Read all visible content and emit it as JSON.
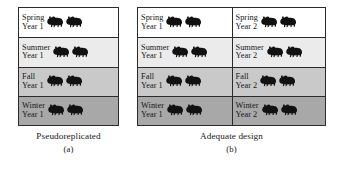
{
  "figure": {
    "background_color": "#ffffff",
    "border_color": "#2b2b2b",
    "text_color": "#15171a",
    "animal_icon": "bison-icon",
    "animal_color": "#111111"
  },
  "row_shades": {
    "spring": "#ffffff",
    "summer": "#ebebeb",
    "fall": "#c9c9c9",
    "winter": "#a8a8a8"
  },
  "panels": [
    {
      "id": "a",
      "name": "pseudoreplicated-panel",
      "caption_title": "Pseudoreplicated",
      "caption_sub": "(a)",
      "columns": [
        {
          "name": "year-1-column",
          "cells": [
            {
              "season": "Spring",
              "year": "Year 1",
              "shade_key": "spring",
              "animals": 2
            },
            {
              "season": "Summer",
              "year": "Year 1",
              "shade_key": "summer",
              "animals": 2
            },
            {
              "season": "Fall",
              "year": "Year 1",
              "shade_key": "fall",
              "animals": 2
            },
            {
              "season": "Winter",
              "year": "Year 1",
              "shade_key": "winter",
              "animals": 2
            }
          ]
        }
      ]
    },
    {
      "id": "b",
      "name": "adequate-design-panel",
      "caption_title": "Adequate design",
      "caption_sub": "(b)",
      "columns": [
        {
          "name": "year-1-column",
          "cells": [
            {
              "season": "Spring",
              "year": "Year 1",
              "shade_key": "spring",
              "animals": 2
            },
            {
              "season": "Summer",
              "year": "Year 1",
              "shade_key": "summer",
              "animals": 2
            },
            {
              "season": "Fall",
              "year": "Year 1",
              "shade_key": "fall",
              "animals": 2
            },
            {
              "season": "Winter",
              "year": "Year 1",
              "shade_key": "winter",
              "animals": 2
            }
          ]
        },
        {
          "name": "year-2-column",
          "cells": [
            {
              "season": "Spring",
              "year": "Year 2",
              "shade_key": "spring",
              "animals": 2
            },
            {
              "season": "Summer",
              "year": "Year 2",
              "shade_key": "summer",
              "animals": 2
            },
            {
              "season": "Fall",
              "year": "Year 2",
              "shade_key": "fall",
              "animals": 2
            },
            {
              "season": "Winter",
              "year": "Year 2",
              "shade_key": "winter",
              "animals": 2
            }
          ]
        }
      ]
    }
  ]
}
